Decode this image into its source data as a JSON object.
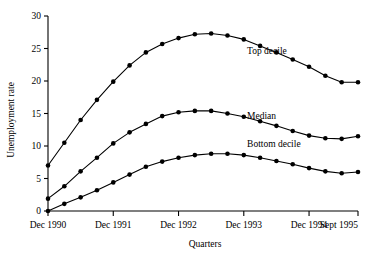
{
  "chart_data": {
    "type": "line",
    "title": "",
    "xlabel": "Quarters",
    "ylabel": "Unemployment rate",
    "ylim": [
      0,
      30
    ],
    "yticks": [
      0,
      5,
      10,
      15,
      20,
      25,
      30
    ],
    "ytick_labels": [
      "0",
      "5",
      "10",
      "15",
      "20",
      "25",
      "30"
    ],
    "grid": false,
    "legend_position": "inline-right",
    "xtick_labels": [
      "Dec 1990",
      "Dec 1991",
      "Dec 1992",
      "Dec 1993",
      "Dec 1994",
      "Sept 1995"
    ],
    "xtick_values": [
      0,
      4,
      8,
      12,
      16,
      19
    ],
    "x": [
      0,
      1,
      2,
      3,
      4,
      5,
      6,
      7,
      8,
      9,
      10,
      11,
      12,
      13,
      14,
      15,
      16,
      17,
      18,
      19
    ],
    "x_quarter_labels": [
      "Dec 1990",
      "Mar 1991",
      "Jun 1991",
      "Sep 1991",
      "Dec 1991",
      "Mar 1992",
      "Jun 1992",
      "Sep 1992",
      "Dec 1992",
      "Mar 1993",
      "Jun 1993",
      "Sep 1993",
      "Dec 1993",
      "Mar 1994",
      "Jun 1994",
      "Sep 1994",
      "Dec 1994",
      "Mar 1995",
      "Jun 1995",
      "Sept 1995"
    ],
    "series": [
      {
        "name": "Top decile",
        "label_x": 12.2,
        "label_y": 24.2,
        "values": [
          7.0,
          10.5,
          14.0,
          17.1,
          19.9,
          22.4,
          24.4,
          25.7,
          26.6,
          27.2,
          27.3,
          27.0,
          26.4,
          25.4,
          24.4,
          23.3,
          22.2,
          20.8,
          19.8,
          19.8
        ]
      },
      {
        "name": "Median",
        "label_x": 12.2,
        "label_y": 14.1,
        "values": [
          1.9,
          3.8,
          6.1,
          8.2,
          10.4,
          12.1,
          13.4,
          14.6,
          15.2,
          15.4,
          15.4,
          15.0,
          14.5,
          13.8,
          13.1,
          12.3,
          11.6,
          11.2,
          11.1,
          11.5
        ]
      },
      {
        "name": "Bottom decile",
        "label_x": 12.2,
        "label_y": 9.9,
        "values": [
          0.0,
          1.1,
          2.1,
          3.2,
          4.4,
          5.6,
          6.8,
          7.6,
          8.2,
          8.6,
          8.8,
          8.8,
          8.6,
          8.2,
          7.7,
          7.2,
          6.6,
          6.1,
          5.8,
          6.0
        ]
      }
    ]
  }
}
